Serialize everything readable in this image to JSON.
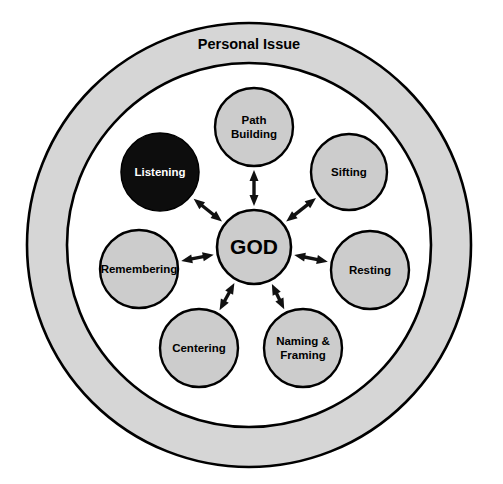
{
  "diagram": {
    "title_visible": false,
    "outer_ring": {
      "label": "Personal Issue",
      "fill": "#d6d6d6",
      "stroke": "#000000",
      "center": [
        249,
        245
      ],
      "outer_radius": 222,
      "inner_radius": 182,
      "label_position": "top-inside-band"
    },
    "center_node": {
      "label": "GOD",
      "fill": "#cccccc",
      "stroke": "#000000",
      "text_color": "#000000",
      "cx": 254,
      "cy": 247,
      "r": 37,
      "font_size": 21
    },
    "node_defaults": {
      "fill": "#cccccc",
      "stroke": "#000000",
      "text_color": "#000000",
      "r": 39,
      "font_size": 11.5
    },
    "highlight": {
      "fill": "#0d0d0d",
      "text_color": "#ffffff"
    },
    "connector": {
      "style": "double-headed-arrow",
      "color": "#111111",
      "line_width": 3.4,
      "head_length": 11,
      "head_width": 9
    },
    "nodes": [
      {
        "id": "path-building",
        "lines": [
          "Path",
          "Building"
        ],
        "cx": 254,
        "cy": 127,
        "r": 39,
        "highlighted": false
      },
      {
        "id": "sifting",
        "lines": [
          "Sifting"
        ],
        "cx": 349,
        "cy": 172,
        "r": 38,
        "highlighted": false
      },
      {
        "id": "resting",
        "lines": [
          "Resting"
        ],
        "cx": 370,
        "cy": 270,
        "r": 39,
        "highlighted": false
      },
      {
        "id": "naming-framing",
        "lines": [
          "Naming &",
          "Framing"
        ],
        "cx": 303,
        "cy": 348,
        "r": 39,
        "highlighted": false
      },
      {
        "id": "centering",
        "lines": [
          "Centering"
        ],
        "cx": 199,
        "cy": 348,
        "r": 39,
        "highlighted": false
      },
      {
        "id": "remembering",
        "lines": [
          "Remembering"
        ],
        "cx": 139,
        "cy": 269,
        "r": 39,
        "highlighted": false
      },
      {
        "id": "listening",
        "lines": [
          "Listening"
        ],
        "cx": 160,
        "cy": 172,
        "r": 39,
        "highlighted": true
      }
    ]
  }
}
